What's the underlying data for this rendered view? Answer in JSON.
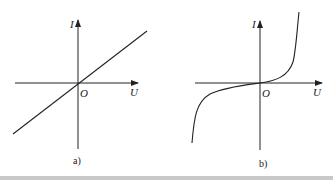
{
  "figure": {
    "panels": [
      {
        "caption": "a)",
        "y_axis_label": "I",
        "x_axis_label": "U",
        "origin_label": "O",
        "curve": "linear"
      },
      {
        "caption": "b)",
        "y_axis_label": "I",
        "x_axis_label": "U",
        "origin_label": "O",
        "curve": "nonlinear-cubic"
      }
    ],
    "stroke_color": "#222222",
    "bottom_bar_color": "#c8c8c8"
  }
}
